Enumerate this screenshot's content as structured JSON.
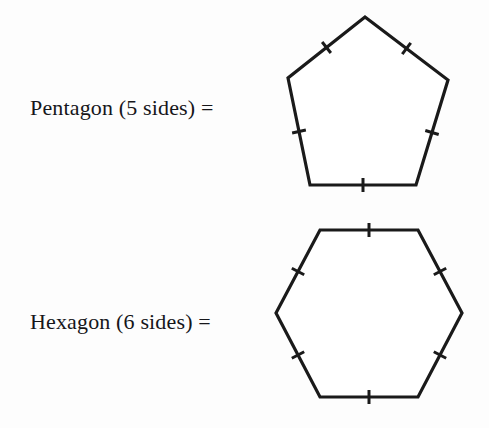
{
  "page": {
    "background_color": "#fdfdfd",
    "ink_color": "#1a1a1a"
  },
  "rows": [
    {
      "id": "pentagon",
      "label": "Pentagon (5 sides) =",
      "shape": {
        "name": "pentagon",
        "sides": 5,
        "tick_count_per_side": 1,
        "vertices": [
          [
            103,
            17
          ],
          [
            186,
            80
          ],
          [
            154,
            185
          ],
          [
            48,
            185
          ],
          [
            26,
            78
          ]
        ]
      }
    },
    {
      "id": "hexagon",
      "label": "Hexagon (6 sides) =",
      "shape": {
        "name": "hexagon",
        "sides": 6,
        "tick_count_per_side": 1,
        "vertices": [
          [
            58,
            16
          ],
          [
            156,
            16
          ],
          [
            200,
            99
          ],
          [
            156,
            183
          ],
          [
            58,
            183
          ],
          [
            14,
            99
          ]
        ]
      }
    }
  ]
}
